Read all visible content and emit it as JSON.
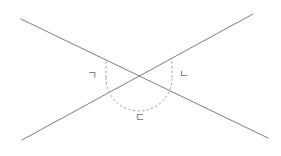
{
  "figure": {
    "type": "geometry-diagram",
    "background_color": "#ffffff",
    "width": 281,
    "height": 156,
    "line_color": "#7d7d7d",
    "arc_color": "#9a9a9a",
    "label_color": "#6f6f6f",
    "intersection": {
      "x": 139,
      "y": 78
    },
    "lines": [
      {
        "name": "line-descending",
        "from": {
          "x": 21,
          "y": 19
        },
        "to": {
          "x": 268,
          "y": 138
        },
        "direction": "upper-left-to-lower-right"
      },
      {
        "name": "line-ascending",
        "from": {
          "x": 22,
          "y": 140
        },
        "to": {
          "x": 253,
          "y": 14
        },
        "direction": "lower-left-to-upper-right"
      }
    ],
    "arc": {
      "name": "angle-arc",
      "style": "dotted",
      "center": {
        "x": 139,
        "y": 78
      },
      "radius": 33,
      "start_angle_deg": 180,
      "end_angle_deg": 360,
      "opens": "downward"
    },
    "labels": [
      {
        "id": "a",
        "text": "ㄱ",
        "romanized": "giyeok",
        "x": 87,
        "y": 70,
        "position": "left-angle"
      },
      {
        "id": "b",
        "text": "ㄴ",
        "romanized": "nieun",
        "x": 179,
        "y": 69,
        "position": "right-angle"
      },
      {
        "id": "c",
        "text": "ㄷ",
        "romanized": "digeut",
        "x": 135,
        "y": 112,
        "position": "bottom-angle"
      }
    ]
  }
}
